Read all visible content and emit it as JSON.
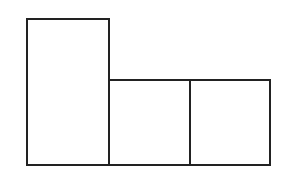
{
  "diagram": {
    "stroke_color": "#222222",
    "background": "#ffffff",
    "shapes": [
      {
        "name": "tall-rectangle",
        "x": 26,
        "y": 18,
        "w": 84,
        "h": 148
      },
      {
        "name": "middle-square",
        "x": 108,
        "y": 79,
        "w": 83,
        "h": 87
      },
      {
        "name": "right-square",
        "x": 189,
        "y": 79,
        "w": 82,
        "h": 87
      }
    ]
  }
}
